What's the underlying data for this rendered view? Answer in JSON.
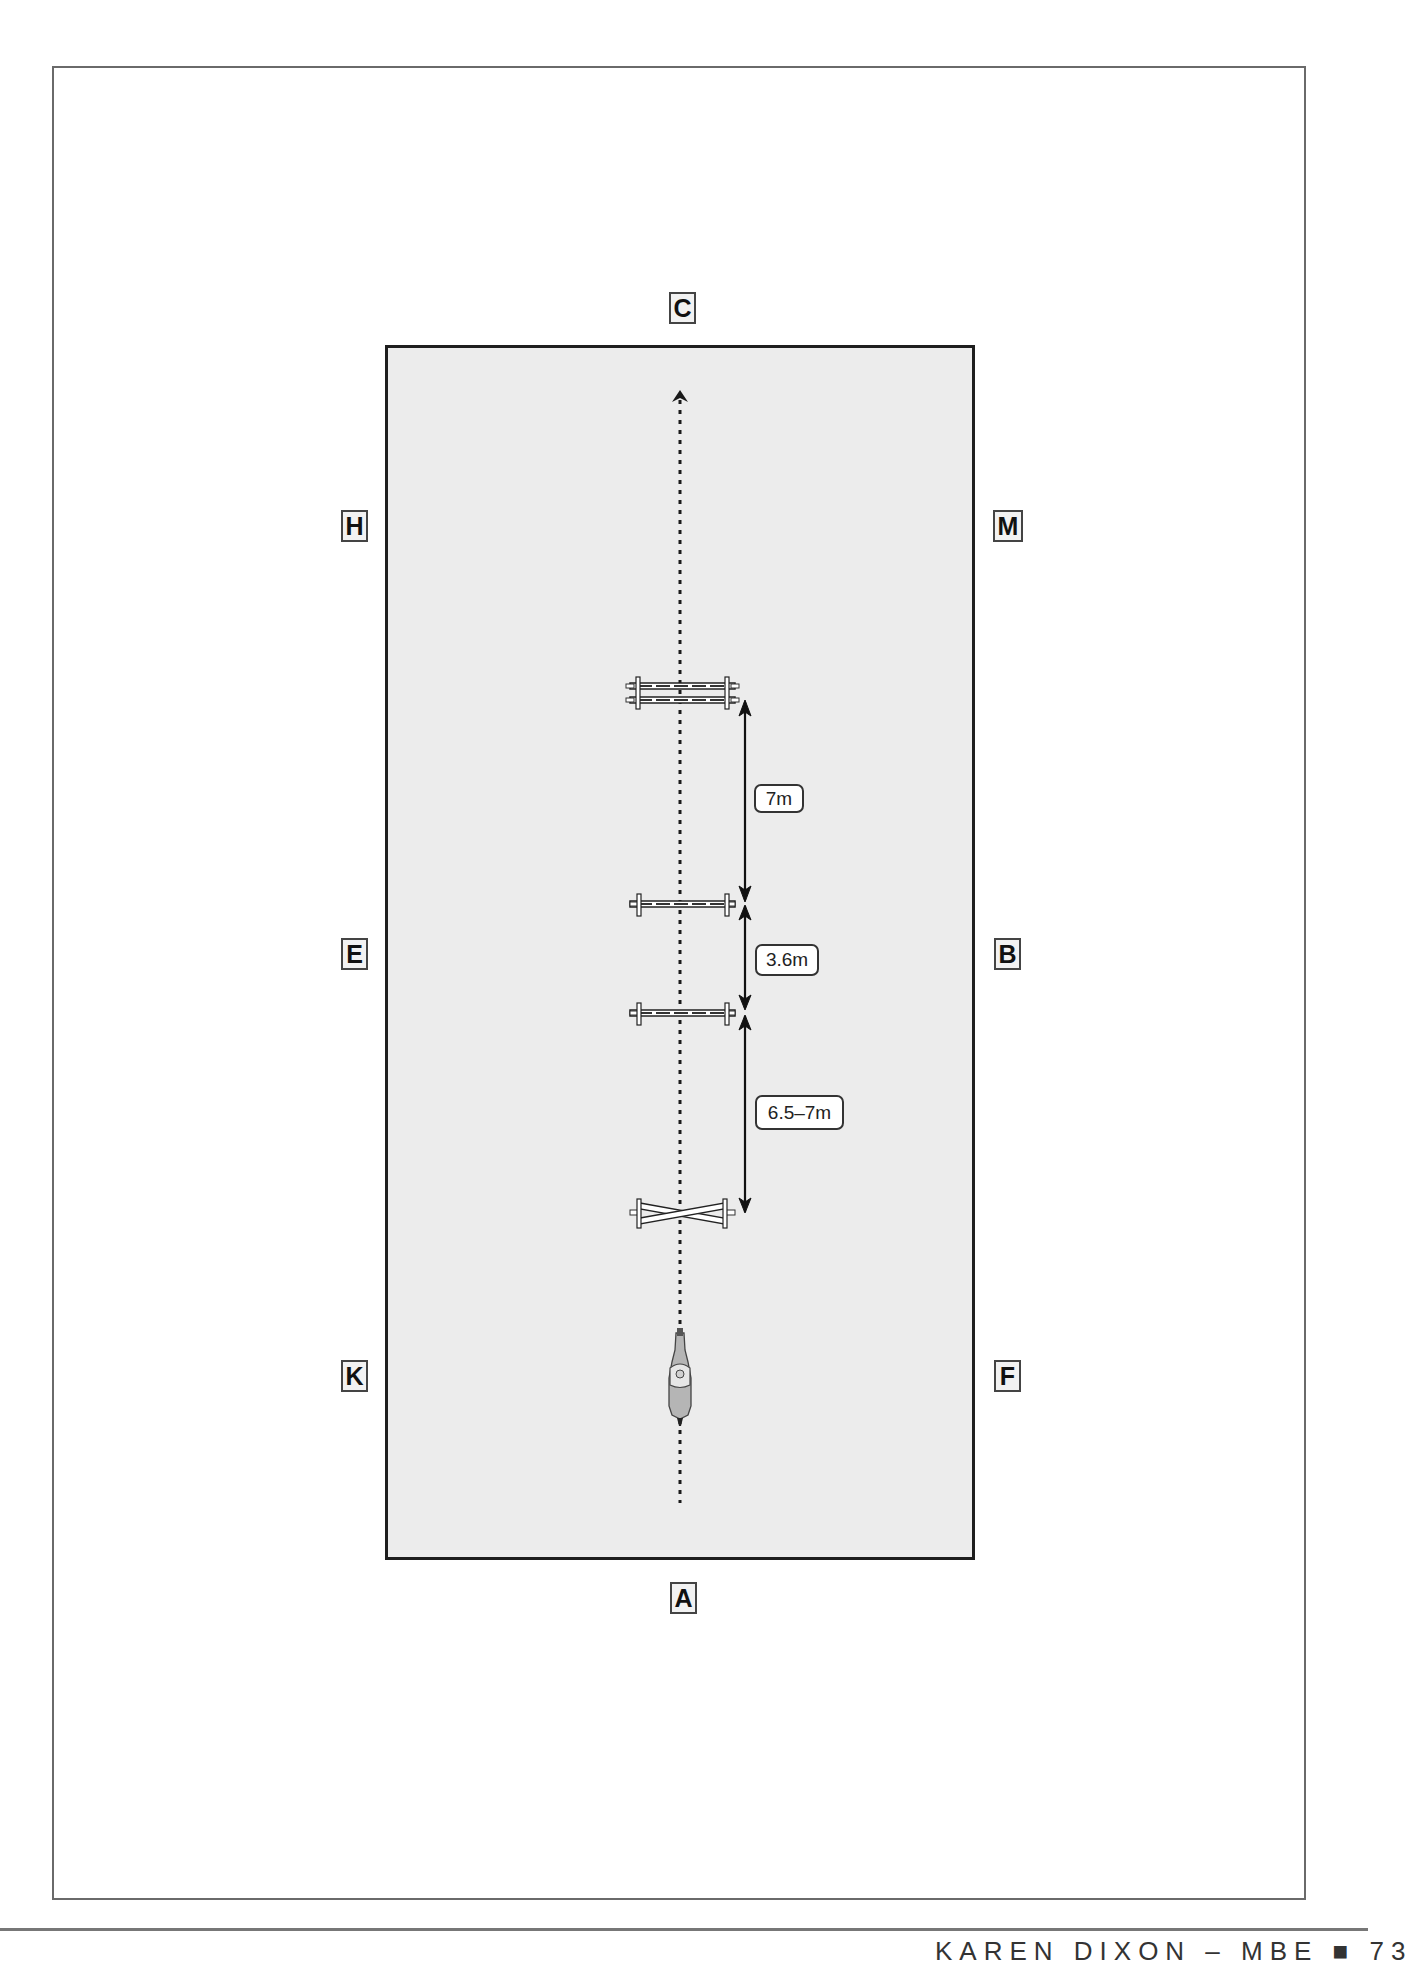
{
  "diagram": {
    "type": "arena-exercise",
    "arena_letters": {
      "top": "C",
      "left_top": "H",
      "right_top": "M",
      "left_mid": "E",
      "right_mid": "B",
      "left_bottom": "K",
      "right_bottom": "F",
      "bottom": "A"
    },
    "elements": [
      {
        "kind": "oxer",
        "label": "double-pole oxer"
      },
      {
        "kind": "pole",
        "label": "ground pole"
      },
      {
        "kind": "pole",
        "label": "ground pole"
      },
      {
        "kind": "cross-pole",
        "label": "cross-pole fence"
      }
    ],
    "distances": [
      {
        "from": "oxer",
        "to": "pole 1",
        "label": "7m"
      },
      {
        "from": "pole 1",
        "to": "pole 2",
        "label": "3.6m"
      },
      {
        "from": "pole 2",
        "to": "cross-pole",
        "label": "6.5–7m"
      }
    ],
    "track": {
      "style": "dotted",
      "direction": "A to C",
      "rider": "horse and rider approaching from A"
    }
  },
  "footer": {
    "text": "KAREN DIXON – MBE ■ 73"
  }
}
